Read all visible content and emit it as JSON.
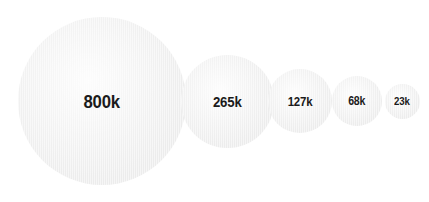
{
  "chart_data": {
    "type": "bubble",
    "title": "",
    "subtitle": "",
    "xlabel": "",
    "ylabel": "",
    "legend": [],
    "grid": false,
    "legend_position": "none",
    "background_color": "#ffffff",
    "bubble_fill_color": "#ececec",
    "label_color": "#1b1b1b",
    "categories": [
      "800k",
      "265k",
      "127k",
      "68k",
      "23k"
    ],
    "values": [
      800000,
      265000,
      127000,
      68000,
      23000
    ],
    "labels": [
      "800k",
      "265k",
      "127k",
      "68k",
      "23k"
    ],
    "points": [
      {
        "label": "800k",
        "value": 800000,
        "diameter_px": 168,
        "center_x_px": 102,
        "center_y_px": 101
      },
      {
        "label": "265k",
        "value": 265000,
        "diameter_px": 93,
        "center_x_px": 227,
        "center_y_px": 101
      },
      {
        "label": "127k",
        "value": 127000,
        "diameter_px": 64,
        "center_x_px": 300,
        "center_y_px": 101
      },
      {
        "label": "68k",
        "value": 68000,
        "diameter_px": 50,
        "center_x_px": 357,
        "center_y_px": 101
      },
      {
        "label": "23k",
        "value": 23000,
        "diameter_px": 35,
        "center_x_px": 402,
        "center_y_px": 101
      }
    ]
  }
}
